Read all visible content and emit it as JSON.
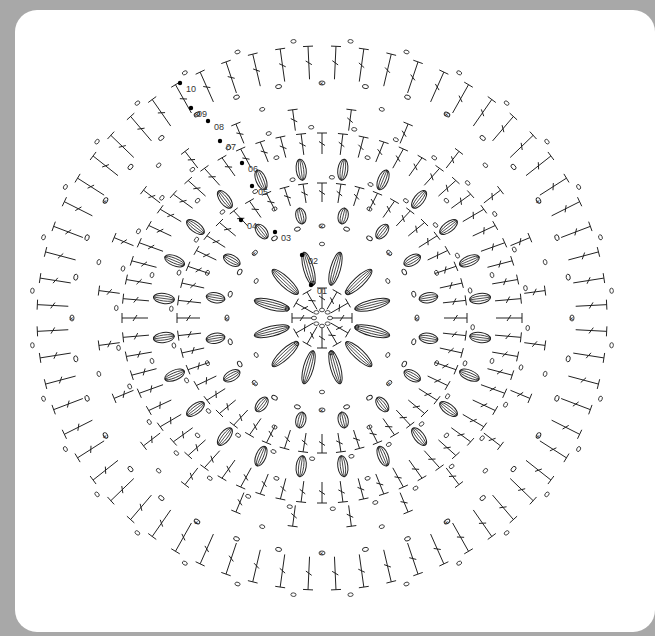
{
  "diagram": {
    "type": "crochet-chart",
    "shape": "oval",
    "center": [
      322,
      318
    ],
    "background_color": "#a8a8a8",
    "card_color": "#ffffff",
    "ink_color": "#222222",
    "round_labels": [
      {
        "text": "01",
        "x": 317,
        "y": 294
      },
      {
        "text": "02",
        "x": 308,
        "y": 264
      },
      {
        "text": "03",
        "x": 281,
        "y": 241
      },
      {
        "text": "04",
        "x": 247,
        "y": 229
      },
      {
        "text": "05",
        "x": 258,
        "y": 195
      },
      {
        "text": "06",
        "x": 248,
        "y": 172
      },
      {
        "text": "07",
        "x": 226,
        "y": 150
      },
      {
        "text": "08",
        "x": 214,
        "y": 130
      },
      {
        "text": "09",
        "x": 197,
        "y": 117
      },
      {
        "text": "10",
        "x": 186,
        "y": 92
      }
    ],
    "rings": [
      {
        "round": 1,
        "rx": 30,
        "ry": 30,
        "count": 12,
        "stitch": "dc"
      },
      {
        "round": 2,
        "rx": 70,
        "ry": 68,
        "count": 12,
        "stitch": "cluster"
      },
      {
        "round": 3,
        "rx": 95,
        "ry": 92,
        "count": 24,
        "stitch": "chain"
      },
      {
        "round": 4,
        "rx": 118,
        "ry": 112,
        "count": 16,
        "stitch": "cluster"
      },
      {
        "round": 5,
        "rx": 145,
        "ry": 135,
        "count": 48,
        "stitch": "dc"
      },
      {
        "round": 6,
        "rx": 170,
        "ry": 160,
        "count": 24,
        "stitch": "cluster"
      },
      {
        "round": 7,
        "rx": 200,
        "ry": 185,
        "count": 60,
        "stitch": "dc"
      },
      {
        "round": 8,
        "rx": 225,
        "ry": 210,
        "count": 24,
        "stitch": "v-dc"
      },
      {
        "round": 9,
        "rx": 250,
        "ry": 235,
        "count": 36,
        "stitch": "chain"
      },
      {
        "round": 10,
        "rx": 285,
        "ry": 272,
        "count": 64,
        "stitch": "dc"
      }
    ],
    "legend_symbols": {
      "chain": "o",
      "single_crochet": "×",
      "slip_stitch": "●",
      "double_crochet": "T",
      "cluster": "puff"
    }
  }
}
